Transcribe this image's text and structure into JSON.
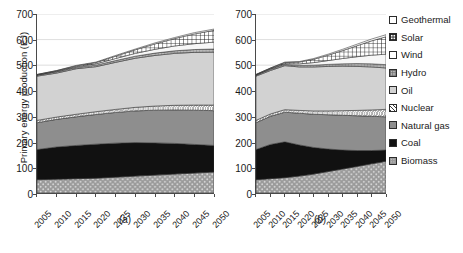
{
  "axis": {
    "ylabel": "Primary energy production (EJ)",
    "yticks": [
      0,
      100,
      200,
      300,
      400,
      500,
      600,
      700
    ],
    "ylim": [
      0,
      700
    ],
    "xticks": [
      "2005",
      "2010",
      "2015",
      "2020",
      "2025",
      "2030",
      "2035",
      "2040",
      "2045",
      "2050"
    ]
  },
  "captions": {
    "a": "(a)",
    "b": "(b)"
  },
  "legend": {
    "items": [
      {
        "label": "Geothermal",
        "pattern": "open-white",
        "swatch_name": "legend-swatch-geothermal"
      },
      {
        "label": "Solar",
        "pattern": "checker-fine",
        "swatch_name": "legend-swatch-solar"
      },
      {
        "label": "Wind",
        "pattern": "open-white",
        "swatch_name": "legend-swatch-wind"
      },
      {
        "label": "Hydro",
        "pattern": "grid-gray",
        "swatch_name": "legend-swatch-hydro"
      },
      {
        "label": "Oil",
        "pattern": "light-gray",
        "swatch_name": "legend-swatch-oil"
      },
      {
        "label": "Nuclear",
        "pattern": "diagonal-hatch",
        "swatch_name": "legend-swatch-nuclear"
      },
      {
        "label": "Natural gas",
        "pattern": "mid-gray",
        "swatch_name": "legend-swatch-natural-gas"
      },
      {
        "label": "Coal",
        "pattern": "solid-black",
        "swatch_name": "legend-swatch-coal"
      },
      {
        "label": "Biomass",
        "pattern": "stipple-gray",
        "swatch_name": "legend-swatch-biomass"
      }
    ]
  },
  "chart_data": [
    {
      "id": "a",
      "type": "area",
      "title": "(a)",
      "xlabel": "",
      "ylabel": "Primary energy production (EJ)",
      "ylim": [
        0,
        700
      ],
      "grid": true,
      "legend_position": "right",
      "x": [
        2005,
        2010,
        2015,
        2020,
        2025,
        2030,
        2035,
        2040,
        2045,
        2050
      ],
      "stack_order_bottom_to_top": [
        "Biomass",
        "Coal",
        "Natural gas",
        "Nuclear",
        "Oil",
        "Hydro",
        "Wind",
        "Solar",
        "Geothermal"
      ],
      "series": [
        {
          "name": "Biomass",
          "values": [
            52,
            54,
            56,
            58,
            62,
            66,
            70,
            74,
            78,
            82
          ]
        },
        {
          "name": "Coal",
          "values": [
            118,
            126,
            130,
            133,
            133,
            131,
            126,
            120,
            112,
            104
          ]
        },
        {
          "name": "Natural gas",
          "values": [
            105,
            108,
            112,
            116,
            120,
            124,
            128,
            131,
            134,
            136
          ]
        },
        {
          "name": "Nuclear",
          "values": [
            9,
            9,
            10,
            11,
            12,
            14,
            16,
            18,
            20,
            22
          ]
        },
        {
          "name": "Oil",
          "values": [
            173,
            172,
            178,
            176,
            184,
            192,
            198,
            203,
            206,
            207
          ]
        },
        {
          "name": "Hydro",
          "values": [
            4,
            5,
            5,
            6,
            7,
            8,
            9,
            10,
            11,
            12
          ]
        },
        {
          "name": "Wind",
          "values": [
            1,
            2,
            3,
            5,
            8,
            11,
            15,
            19,
            23,
            27
          ]
        },
        {
          "name": "Solar",
          "values": [
            1,
            2,
            3,
            5,
            9,
            14,
            21,
            29,
            38,
            46
          ]
        },
        {
          "name": "Geothermal",
          "values": [
            1,
            1,
            2,
            2,
            3,
            3,
            4,
            4,
            5,
            5
          ]
        }
      ],
      "totals": [
        464,
        479,
        499,
        512,
        538,
        563,
        587,
        608,
        627,
        641
      ]
    },
    {
      "id": "b",
      "type": "area",
      "title": "(b)",
      "xlabel": "",
      "ylabel": "",
      "ylim": [
        0,
        700
      ],
      "grid": true,
      "legend_position": "right",
      "x": [
        2005,
        2010,
        2015,
        2020,
        2025,
        2030,
        2035,
        2040,
        2045,
        2050
      ],
      "stack_order_bottom_to_top": [
        "Biomass",
        "Coal",
        "Natural gas",
        "Nuclear",
        "Oil",
        "Hydro",
        "Wind",
        "Solar",
        "Geothermal"
      ],
      "series": [
        {
          "name": "Biomass",
          "values": [
            52,
            56,
            60,
            66,
            74,
            84,
            94,
            104,
            114,
            124
          ]
        },
        {
          "name": "Coal",
          "values": [
            118,
            134,
            140,
            122,
            104,
            88,
            74,
            62,
            52,
            44
          ]
        },
        {
          "name": "Natural gas",
          "values": [
            105,
            110,
            116,
            124,
            130,
            134,
            136,
            136,
            134,
            130
          ]
        },
        {
          "name": "Nuclear",
          "values": [
            9,
            9,
            10,
            11,
            13,
            15,
            18,
            21,
            25,
            29
          ]
        },
        {
          "name": "Oil",
          "values": [
            173,
            170,
            172,
            170,
            172,
            174,
            174,
            172,
            168,
            162
          ]
        },
        {
          "name": "Hydro",
          "values": [
            4,
            5,
            5,
            6,
            7,
            8,
            9,
            11,
            12,
            13
          ]
        },
        {
          "name": "Wind",
          "values": [
            1,
            2,
            3,
            6,
            10,
            15,
            21,
            27,
            34,
            41
          ]
        },
        {
          "name": "Solar",
          "values": [
            1,
            2,
            4,
            7,
            13,
            21,
            31,
            43,
            56,
            68
          ]
        },
        {
          "name": "Geothermal",
          "values": [
            1,
            1,
            2,
            2,
            3,
            4,
            5,
            6,
            7,
            8
          ]
        }
      ],
      "totals": [
        464,
        489,
        512,
        514,
        526,
        543,
        562,
        582,
        602,
        619
      ]
    }
  ]
}
